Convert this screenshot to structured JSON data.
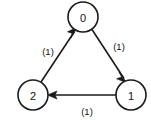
{
  "diagram": {
    "type": "directed-graph",
    "background_color": "#ffffff",
    "stroke_color": "#1a1a1a",
    "text_color": "#111111",
    "nodes": [
      {
        "id": "node-0",
        "label": "0",
        "cx": 83,
        "cy": 17,
        "r": 15
      },
      {
        "id": "node-1",
        "label": "1",
        "cx": 131,
        "cy": 95,
        "r": 15
      },
      {
        "id": "node-2",
        "label": "2",
        "cx": 33,
        "cy": 95,
        "r": 15
      }
    ],
    "edges": [
      {
        "id": "edge-2-to-0",
        "from": "2",
        "to": "0",
        "label": "(1)",
        "label_x": 48,
        "label_y": 51,
        "x1": 41,
        "y1": 82,
        "x2": 75,
        "y2": 31
      },
      {
        "id": "edge-0-to-1",
        "from": "0",
        "to": "1",
        "label": "(1)",
        "label_x": 119,
        "label_y": 46,
        "x1": 92,
        "y1": 30,
        "x2": 124,
        "y2": 79
      },
      {
        "id": "edge-1-to-2",
        "from": "1",
        "to": "2",
        "label": "(1)",
        "label_x": 87,
        "label_y": 111,
        "x1": 116,
        "y1": 95,
        "x2": 48,
        "y2": 95
      }
    ]
  }
}
